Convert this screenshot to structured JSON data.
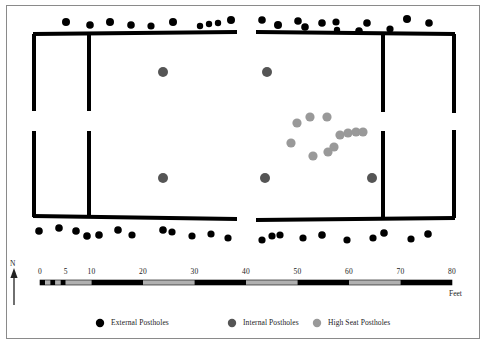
{
  "figure": {
    "type": "archaeological-site-plan",
    "title": "",
    "background_color": "#ffffff",
    "frame_color": "#8a8a8a"
  },
  "colors": {
    "external_posthole": "#000000",
    "internal_posthole": "#555555",
    "high_seat_posthole": "#999999",
    "wall": "#000000",
    "scale_bar_dark": "#000000",
    "scale_bar_light": "#b0b0b0",
    "text": "#1a1a1a"
  },
  "north_arrow": {
    "label": "N"
  },
  "scale_bar": {
    "units_label": "Feet",
    "ticks": [
      "0",
      "5",
      "10",
      "20",
      "30",
      "40",
      "50",
      "60",
      "70",
      "80"
    ],
    "tick_values": [
      0,
      5,
      10,
      20,
      30,
      40,
      50,
      60,
      70,
      80
    ],
    "min": 0,
    "max": 80,
    "x_start_px": 40,
    "x_end_px": 452,
    "segments": [
      {
        "from": 0,
        "to": 1,
        "fill": "dark"
      },
      {
        "from": 1,
        "to": 2,
        "fill": "light"
      },
      {
        "from": 2,
        "to": 3,
        "fill": "dark"
      },
      {
        "from": 3,
        "to": 4,
        "fill": "light"
      },
      {
        "from": 4,
        "to": 5,
        "fill": "dark"
      },
      {
        "from": 5,
        "to": 10,
        "fill": "light"
      },
      {
        "from": 10,
        "to": 20,
        "fill": "dark"
      },
      {
        "from": 20,
        "to": 30,
        "fill": "light"
      },
      {
        "from": 30,
        "to": 40,
        "fill": "dark"
      },
      {
        "from": 40,
        "to": 50,
        "fill": "light"
      },
      {
        "from": 50,
        "to": 60,
        "fill": "dark"
      },
      {
        "from": 60,
        "to": 70,
        "fill": "light"
      },
      {
        "from": 70,
        "to": 80,
        "fill": "dark"
      }
    ]
  },
  "legend": {
    "items": [
      {
        "label": "External Postholes",
        "color": "#000000",
        "symbol": "filled-circle",
        "x": 100,
        "y": 323,
        "radius": 4.2
      },
      {
        "label": "Internal Postholes",
        "color": "#555555",
        "symbol": "filled-circle",
        "x": 232,
        "y": 323,
        "radius": 4.2
      },
      {
        "label": "High Seat Postholes",
        "color": "#999999",
        "symbol": "filled-circle",
        "x": 317,
        "y": 323,
        "radius": 4.2
      }
    ]
  },
  "plan": {
    "walls": [
      {
        "name": "top-wall-left",
        "x1": 33,
        "y1": 34,
        "x2": 237,
        "y2": 32,
        "width": 4
      },
      {
        "name": "top-wall-right",
        "x1": 256,
        "y1": 32,
        "x2": 455,
        "y2": 34,
        "width": 4
      },
      {
        "name": "bottom-wall-left",
        "x1": 33,
        "y1": 216,
        "x2": 237,
        "y2": 219,
        "width": 4
      },
      {
        "name": "bottom-wall-right",
        "x1": 256,
        "y1": 220,
        "x2": 455,
        "y2": 218,
        "width": 4
      },
      {
        "name": "left-end-wall-upper",
        "x1": 34,
        "y1": 34,
        "x2": 34,
        "y2": 111,
        "width": 4
      },
      {
        "name": "left-end-wall-lower",
        "x1": 34,
        "y1": 131,
        "x2": 34,
        "y2": 217,
        "width": 4
      },
      {
        "name": "right-end-wall-upper",
        "x1": 454,
        "y1": 34,
        "x2": 454,
        "y2": 113,
        "width": 4
      },
      {
        "name": "right-end-wall-lower",
        "x1": 454,
        "y1": 130,
        "x2": 454,
        "y2": 218,
        "width": 4
      },
      {
        "name": "partition-wall-left-upper",
        "x1": 89,
        "y1": 33,
        "x2": 89,
        "y2": 111,
        "width": 4
      },
      {
        "name": "partition-wall-left-lower",
        "x1": 89,
        "y1": 131,
        "x2": 89,
        "y2": 217,
        "width": 4
      },
      {
        "name": "partition-wall-right-upper",
        "x1": 383,
        "y1": 33,
        "x2": 383,
        "y2": 112,
        "width": 4
      },
      {
        "name": "partition-wall-right-lower",
        "x1": 383,
        "y1": 131,
        "x2": 383,
        "y2": 218,
        "width": 4
      }
    ],
    "external_postholes": [
      {
        "x": 66,
        "y": 22,
        "r": 4.0
      },
      {
        "x": 90,
        "y": 25,
        "r": 3.8
      },
      {
        "x": 110,
        "y": 22,
        "r": 4.0
      },
      {
        "x": 131,
        "y": 25,
        "r": 3.8
      },
      {
        "x": 151,
        "y": 26,
        "r": 3.6
      },
      {
        "x": 173,
        "y": 22,
        "r": 4.0
      },
      {
        "x": 200,
        "y": 26,
        "r": 3.2
      },
      {
        "x": 209,
        "y": 24,
        "r": 3.2
      },
      {
        "x": 218,
        "y": 23,
        "r": 3.2
      },
      {
        "x": 231,
        "y": 20,
        "r": 4.0
      },
      {
        "x": 262,
        "y": 20,
        "r": 3.8
      },
      {
        "x": 278,
        "y": 25,
        "r": 4.0
      },
      {
        "x": 298,
        "y": 21,
        "r": 3.8
      },
      {
        "x": 305,
        "y": 27,
        "r": 3.8
      },
      {
        "x": 322,
        "y": 23,
        "r": 3.8
      },
      {
        "x": 336,
        "y": 22,
        "r": 3.6
      },
      {
        "x": 337,
        "y": 30,
        "r": 3.2
      },
      {
        "x": 359,
        "y": 31,
        "r": 3.8
      },
      {
        "x": 367,
        "y": 23,
        "r": 3.8
      },
      {
        "x": 390,
        "y": 29,
        "r": 3.6
      },
      {
        "x": 407,
        "y": 19,
        "r": 4.0
      },
      {
        "x": 429,
        "y": 23,
        "r": 3.8
      },
      {
        "x": 39,
        "y": 231,
        "r": 3.8
      },
      {
        "x": 59,
        "y": 228,
        "r": 3.8
      },
      {
        "x": 76,
        "y": 231,
        "r": 3.8
      },
      {
        "x": 87,
        "y": 236,
        "r": 3.8
      },
      {
        "x": 99,
        "y": 235,
        "r": 3.8
      },
      {
        "x": 118,
        "y": 230,
        "r": 3.8
      },
      {
        "x": 132,
        "y": 235,
        "r": 3.6
      },
      {
        "x": 163,
        "y": 230,
        "r": 3.8
      },
      {
        "x": 172,
        "y": 232,
        "r": 3.6
      },
      {
        "x": 192,
        "y": 236,
        "r": 3.6
      },
      {
        "x": 211,
        "y": 234,
        "r": 3.6
      },
      {
        "x": 228,
        "y": 238,
        "r": 3.6
      },
      {
        "x": 262,
        "y": 240,
        "r": 3.6
      },
      {
        "x": 272,
        "y": 236,
        "r": 3.6
      },
      {
        "x": 280,
        "y": 235,
        "r": 3.6
      },
      {
        "x": 303,
        "y": 238,
        "r": 3.6
      },
      {
        "x": 322,
        "y": 235,
        "r": 3.8
      },
      {
        "x": 347,
        "y": 240,
        "r": 3.6
      },
      {
        "x": 373,
        "y": 238,
        "r": 3.6
      },
      {
        "x": 384,
        "y": 233,
        "r": 3.8
      },
      {
        "x": 411,
        "y": 239,
        "r": 3.6
      },
      {
        "x": 428,
        "y": 234,
        "r": 3.8
      }
    ],
    "internal_postholes": [
      {
        "x": 163,
        "y": 72,
        "r": 5.0
      },
      {
        "x": 163,
        "y": 178,
        "r": 5.0
      },
      {
        "x": 267,
        "y": 72,
        "r": 5.0
      },
      {
        "x": 265,
        "y": 178,
        "r": 5.0
      },
      {
        "x": 372,
        "y": 178,
        "r": 5.0
      }
    ],
    "high_seat_postholes": [
      {
        "x": 297,
        "y": 123,
        "r": 4.6
      },
      {
        "x": 310,
        "y": 117,
        "r": 4.6
      },
      {
        "x": 327,
        "y": 117,
        "r": 4.6
      },
      {
        "x": 291,
        "y": 143,
        "r": 4.6
      },
      {
        "x": 313,
        "y": 156,
        "r": 4.6
      },
      {
        "x": 328,
        "y": 152,
        "r": 4.6
      },
      {
        "x": 334,
        "y": 147,
        "r": 4.6
      },
      {
        "x": 340,
        "y": 135,
        "r": 4.6
      },
      {
        "x": 348,
        "y": 133,
        "r": 4.6
      },
      {
        "x": 356,
        "y": 132,
        "r": 4.6
      },
      {
        "x": 363,
        "y": 132,
        "r": 4.6
      }
    ]
  }
}
